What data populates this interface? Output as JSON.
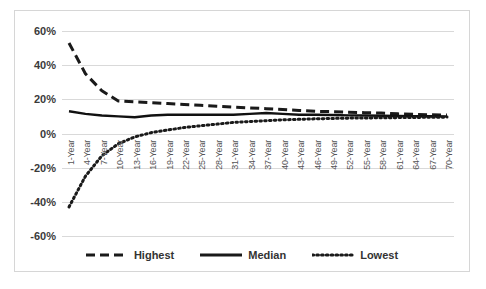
{
  "chart_data": {
    "type": "line",
    "title": "",
    "xlabel": "",
    "ylabel": "",
    "ylim": [
      -60,
      60
    ],
    "ytick_labels": [
      "60%",
      "40%",
      "20%",
      "0%",
      "-20%",
      "-40%",
      "-60%"
    ],
    "ytick_values": [
      60,
      40,
      20,
      0,
      -20,
      -40,
      -60
    ],
    "grid": true,
    "legend_position": "bottom",
    "x_axis_label_suffix": "-Year",
    "categories": [
      "1-Year",
      "4-Year",
      "7-Year",
      "10-Year",
      "13-Year",
      "16-Year",
      "19-Year",
      "22-Year",
      "25-Year",
      "28-Year",
      "31-Year",
      "34-Year",
      "37-Year",
      "40-Year",
      "43-Year",
      "46-Year",
      "49-Year",
      "52-Year",
      "55-Year",
      "58-Year",
      "61-Year",
      "64-Year",
      "67-Year",
      "70-Year"
    ],
    "x_values": [
      1,
      4,
      7,
      10,
      13,
      16,
      19,
      22,
      25,
      28,
      31,
      34,
      37,
      40,
      43,
      46,
      49,
      52,
      55,
      58,
      61,
      64,
      67,
      70
    ],
    "series": [
      {
        "name": "Highest",
        "style": "dashed",
        "color": "#1a1a1a",
        "values": [
          53,
          35,
          25,
          19,
          18.5,
          18,
          17.5,
          17,
          16.5,
          16,
          15.5,
          15,
          14.5,
          14,
          13.5,
          13,
          12.8,
          12.5,
          12.2,
          12,
          11.5,
          11.2,
          11,
          10.8
        ]
      },
      {
        "name": "Median",
        "style": "solid",
        "color": "#111111",
        "values": [
          13,
          11.5,
          10.5,
          10,
          9.5,
          10.5,
          11,
          11,
          11,
          11,
          11,
          11.5,
          12,
          11.5,
          11,
          11,
          10.8,
          10.6,
          10.5,
          10.4,
          10.3,
          10.2,
          10.1,
          10
        ]
      },
      {
        "name": "Lowest",
        "style": "dotted",
        "color": "#1a1a1a",
        "values": [
          -43,
          -25,
          -13,
          -6,
          -2,
          0.5,
          2,
          3.5,
          4.5,
          5.5,
          6.5,
          7,
          7.5,
          8,
          8.3,
          8.6,
          8.8,
          9,
          9.1,
          9.2,
          9.3,
          9.4,
          9.5,
          9.6
        ]
      }
    ],
    "legend": [
      {
        "label": "Highest",
        "style": "dashed"
      },
      {
        "label": "Median",
        "style": "solid"
      },
      {
        "label": "Lowest",
        "style": "dotted"
      }
    ]
  },
  "colors": {
    "gridline": "#d9d9d9",
    "frame": "#d6d6d6",
    "series": "#1a1a1a",
    "axis_text": "#3a3a3a",
    "background": "#ffffff"
  }
}
